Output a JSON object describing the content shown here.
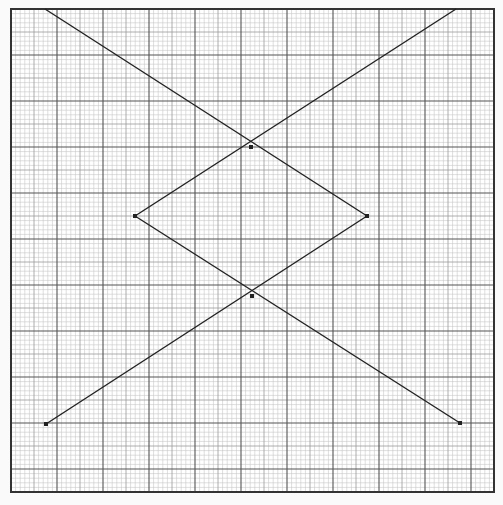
{
  "figure": {
    "type": "graph-paper-diagram",
    "colors": {
      "background": "#fafafa",
      "paper": "#ffffff",
      "minor_grid": "#c8c8c8",
      "medium_grid": "#9a9a9a",
      "major_grid": "#555555",
      "border": "#333333",
      "line": "#222222"
    },
    "frame": {
      "left": 11,
      "top": 9,
      "right": 494,
      "bottom": 492
    },
    "grid": {
      "minor_spacing": 4.6,
      "medium_every": 5,
      "major_every": 10
    },
    "points": [
      {
        "name": "top-left-start",
        "x": 45,
        "y": 9
      },
      {
        "name": "upper-crossing",
        "x": 251,
        "y": 147
      },
      {
        "name": "top-right-end",
        "x": 456,
        "y": 9
      },
      {
        "name": "left-vertex",
        "x": 135,
        "y": 216
      },
      {
        "name": "right-vertex",
        "x": 367,
        "y": 216
      },
      {
        "name": "lower-crossing",
        "x": 252,
        "y": 296
      },
      {
        "name": "bottom-left-end",
        "x": 46,
        "y": 424
      },
      {
        "name": "bottom-right-end",
        "x": 460,
        "y": 423
      }
    ],
    "segments": [
      {
        "name": "line-top-left-to-right-vertex",
        "from": [
          45,
          9
        ],
        "to": [
          367,
          216
        ]
      },
      {
        "name": "line-right-vertex-to-bottom-left",
        "from": [
          367,
          216
        ],
        "to": [
          46,
          424
        ]
      },
      {
        "name": "line-bottom-right-to-left-vertex",
        "from": [
          460,
          423
        ],
        "to": [
          135,
          216
        ]
      },
      {
        "name": "line-left-vertex-to-top-right",
        "from": [
          135,
          216
        ],
        "to": [
          456,
          9
        ]
      }
    ],
    "markers": [
      {
        "name": "left-vertex-marker",
        "x": 135,
        "y": 216
      },
      {
        "name": "right-vertex-marker",
        "x": 367,
        "y": 216
      },
      {
        "name": "upper-crossing-marker",
        "x": 251,
        "y": 147
      },
      {
        "name": "lower-crossing-marker",
        "x": 252,
        "y": 296
      },
      {
        "name": "bottom-left-marker",
        "x": 46,
        "y": 424
      },
      {
        "name": "bottom-right-marker",
        "x": 460,
        "y": 423
      }
    ]
  }
}
